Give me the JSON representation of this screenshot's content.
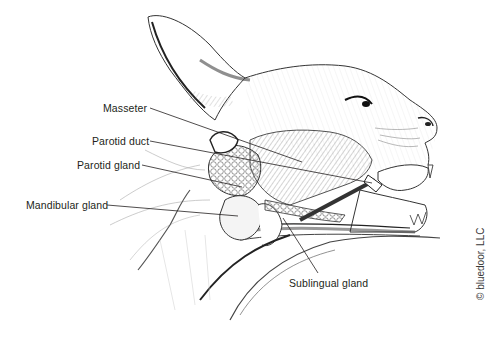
{
  "figure": {
    "labels": [
      {
        "id": "masseter",
        "text": "Masseter",
        "x": 103,
        "y": 103,
        "leader": [
          [
            150,
            108
          ],
          [
            302,
            162
          ]
        ]
      },
      {
        "id": "parotid-duct",
        "text": "Parotid duct",
        "x": 92,
        "y": 136,
        "leader": [
          [
            150,
            141
          ],
          [
            372,
            183
          ]
        ]
      },
      {
        "id": "parotid-gland",
        "text": "Parotid gland",
        "x": 77,
        "y": 160,
        "leader": [
          [
            142,
            165
          ],
          [
            242,
            187
          ]
        ]
      },
      {
        "id": "mandibular-gland",
        "text": "Mandibular gland",
        "x": 26,
        "y": 200,
        "leader": [
          [
            107,
            205
          ],
          [
            238,
            216
          ]
        ]
      },
      {
        "id": "sublingual-gland",
        "text": "Sublingual gland",
        "x": 289,
        "y": 278,
        "leader": [
          [
            318,
            273
          ],
          [
            283,
            218
          ]
        ]
      }
    ],
    "copyright": "© bluedoor, LLC"
  },
  "colors": {
    "ink": "#231f20",
    "background": "#ffffff",
    "shade": "#8a8a8a"
  }
}
